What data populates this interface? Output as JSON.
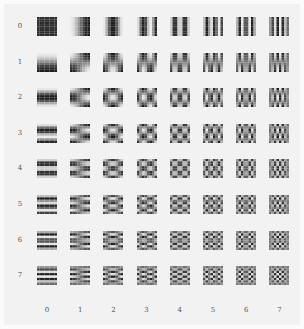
{
  "diagram": {
    "title": "",
    "type": "DCT 8x8 basis functions grid",
    "row_labels": [
      "0",
      "1",
      "2",
      "3",
      "4",
      "5",
      "6",
      "7"
    ],
    "col_labels": [
      "0",
      "1",
      "2",
      "3",
      "4",
      "5",
      "6",
      "7"
    ],
    "n": 8,
    "colors": {
      "background": "#f2f2f2",
      "page": "#fbfbfb",
      "label": "#555555"
    }
  }
}
